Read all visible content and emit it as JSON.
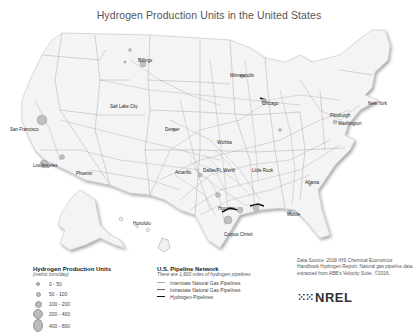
{
  "title": "Hydrogen Production Units in the United States",
  "cities": [
    {
      "name": "Billings",
      "x": 138,
      "y": 58
    },
    {
      "name": "Minneapolis",
      "x": 230,
      "y": 73
    },
    {
      "name": "Salt Lake City",
      "x": 110,
      "y": 104
    },
    {
      "name": "Chicago",
      "x": 262,
      "y": 101
    },
    {
      "name": "New York",
      "x": 368,
      "y": 101
    },
    {
      "name": "Pittsburgh",
      "x": 330,
      "y": 113
    },
    {
      "name": "Washington",
      "x": 338,
      "y": 121
    },
    {
      "name": "Denver",
      "x": 165,
      "y": 127
    },
    {
      "name": "San Francisco",
      "x": 18,
      "y": 127
    },
    {
      "name": "Wichita",
      "x": 217,
      "y": 140
    },
    {
      "name": "Los Angeles",
      "x": 33,
      "y": 163
    },
    {
      "name": "Phoenix",
      "x": 76,
      "y": 171
    },
    {
      "name": "Amarillo",
      "x": 175,
      "y": 170
    },
    {
      "name": "Dallas/Ft. Worth",
      "x": 203,
      "y": 168
    },
    {
      "name": "Little Rock",
      "x": 252,
      "y": 168
    },
    {
      "name": "Atlanta",
      "x": 305,
      "y": 180
    },
    {
      "name": "Mobile",
      "x": 287,
      "y": 212
    },
    {
      "name": "Houston",
      "x": 228,
      "y": 214
    },
    {
      "name": "Corpus Christi",
      "x": 224,
      "y": 232
    },
    {
      "name": "Honolulu",
      "x": 133,
      "y": 221
    }
  ],
  "legend_production": {
    "title": "Hydrogen Production Units",
    "subtitle": "(metric tons/day)",
    "items": [
      {
        "label": "0 - 50",
        "size": 2
      },
      {
        "label": "50 - 100",
        "size": 3
      },
      {
        "label": "100 - 200",
        "size": 5
      },
      {
        "label": "200 - 400",
        "size": 8
      },
      {
        "label": "400 - 800",
        "size": 11
      }
    ]
  },
  "legend_pipeline": {
    "title": "U.S. Pipeline Network",
    "subtitle": "There are 1,600 miles of hydrogen pipelines",
    "items": [
      {
        "label": "Interstate Natural Gas Pipelines",
        "color": "#aaaaaa",
        "width": 1
      },
      {
        "label": "Intrastate Natural Gas Pipelines",
        "color": "#666666",
        "width": 1
      },
      {
        "label": "Hydrogen Pipelines",
        "color": "#111111",
        "width": 1.5
      }
    ]
  },
  "source": "Data Source: 2018 IHS Chemical Economics Handbook Hydrogen Report. Natural gas pipeline data extracted from ABB's Velocity Suite, ©2016.",
  "logo": {
    "mark": "⁙⁙",
    "text": "NREL"
  }
}
